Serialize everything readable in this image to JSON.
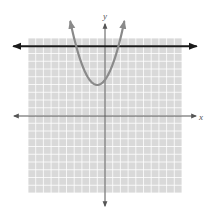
{
  "chart_data": {
    "type": "line",
    "title": "",
    "xlabel": "x",
    "ylabel": "y",
    "xlim": [
      -10,
      10
    ],
    "ylim": [
      -10,
      10
    ],
    "grid": true,
    "grid_step": 1,
    "legend": null,
    "series": [
      {
        "name": "parabola",
        "kind": "quadratic",
        "equation": "y = (2/3)(x + 1)^2 + 4",
        "vertex": [
          -1,
          4
        ],
        "color": "#8a8a8a",
        "arrows": "both-ends",
        "points": [
          [
            -4.5,
            12.17
          ],
          [
            -4,
            10
          ],
          [
            -3.74,
            9
          ],
          [
            -3,
            6.67
          ],
          [
            -2,
            4.67
          ],
          [
            -1,
            4
          ],
          [
            0,
            4.67
          ],
          [
            1,
            6.67
          ],
          [
            1.74,
            9
          ],
          [
            2,
            10
          ],
          [
            2.5,
            12.17
          ]
        ]
      },
      {
        "name": "horizontal line",
        "kind": "linear",
        "equation": "y = 9",
        "color": "#1a1a1a",
        "arrows": "both-ends",
        "points": [
          [
            -11.5,
            9
          ],
          [
            11.5,
            9
          ]
        ]
      }
    ],
    "intersections": [
      [
        -3.74,
        9
      ],
      [
        1.74,
        9
      ]
    ]
  },
  "labels": {
    "x_axis": "x",
    "y_axis": "y"
  },
  "colors": {
    "grid_fill": "#d9d9d9",
    "grid_line": "#ffffff",
    "axis": "#555555",
    "parabola": "#8a8a8a",
    "line": "#1a1a1a"
  }
}
